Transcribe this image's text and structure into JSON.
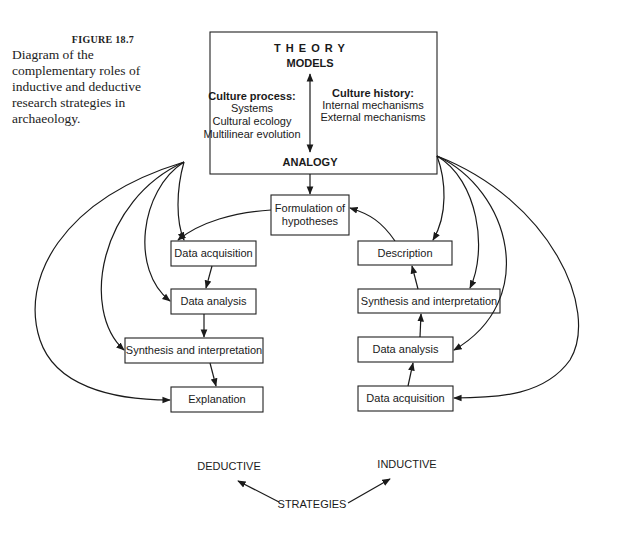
{
  "caption": {
    "figure_label": "FIGURE 18.7",
    "text": "Diagram of the complementary roles of inductive and deductive research strategies in archaeology."
  },
  "theory_box": {
    "title": "T H E O R Y",
    "models": "MODELS",
    "analogy": "ANALOGY",
    "culture_process": {
      "heading": "Culture process:",
      "items": [
        "Systems",
        "Cultural ecology",
        "Multilinear evolution"
      ]
    },
    "culture_history": {
      "heading": "Culture history:",
      "items": [
        "Internal mechanisms",
        "External mechanisms"
      ]
    }
  },
  "formulation": {
    "line1": "Formulation of",
    "line2": "hypotheses"
  },
  "deductive_column": {
    "steps": [
      "Data acquisition",
      "Data analysis",
      "Synthesis and interpretation",
      "Explanation"
    ]
  },
  "inductive_column": {
    "steps": [
      "Description",
      "Synthesis and interpretation",
      "Data analysis",
      "Data acquisition"
    ]
  },
  "strategies": {
    "deductive": "DEDUCTIVE",
    "inductive": "INDUCTIVE",
    "label": "STRATEGIES"
  },
  "colors": {
    "ink": "#1a1a1a",
    "background": "#ffffff"
  }
}
